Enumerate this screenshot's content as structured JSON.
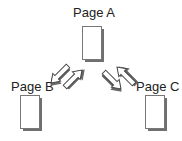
{
  "nodes": [
    {
      "id": "page-a",
      "label": "Page A"
    },
    {
      "id": "page-b",
      "label": "Page B"
    },
    {
      "id": "page-c",
      "label": "Page C"
    }
  ],
  "edges": [
    {
      "from": "page-a",
      "to": "page-b"
    },
    {
      "from": "page-b",
      "to": "page-a"
    },
    {
      "from": "page-a",
      "to": "page-c"
    },
    {
      "from": "page-c",
      "to": "page-a"
    }
  ]
}
